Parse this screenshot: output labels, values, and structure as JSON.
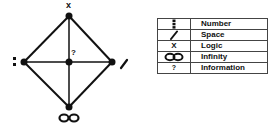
{
  "diagram": {
    "nodes": [
      {
        "id": "top",
        "symbol": "X",
        "meaning": "Logic",
        "x": 69,
        "y": 16
      },
      {
        "id": "left",
        "symbol": "⁝",
        "meaning": "Number",
        "x": 24,
        "y": 62
      },
      {
        "id": "right",
        "symbol": "/",
        "meaning": "Space",
        "x": 112,
        "y": 62
      },
      {
        "id": "bottom",
        "symbol": "∞",
        "meaning": "Infinity",
        "x": 69,
        "y": 107
      },
      {
        "id": "center",
        "symbol": "?",
        "meaning": "Information",
        "x": 69,
        "y": 62
      }
    ],
    "labels": {
      "top": "x",
      "center": "?",
      "bottom": "∞"
    },
    "edges": [
      [
        "top",
        "left"
      ],
      [
        "top",
        "right"
      ],
      [
        "bottom",
        "left"
      ],
      [
        "bottom",
        "right"
      ],
      [
        "top",
        "bottom"
      ],
      [
        "left",
        "right"
      ]
    ],
    "line_color": "#111111"
  },
  "legend": {
    "rows": [
      {
        "symbol_icon": "triple-dot-icon",
        "symbol": "⁝",
        "label": "Number"
      },
      {
        "symbol_icon": "slash-icon",
        "symbol": "/",
        "label": "Space"
      },
      {
        "symbol_icon": "x-icon",
        "symbol": "X",
        "label": "Logic"
      },
      {
        "symbol_icon": "infinity-icon",
        "symbol": "∞",
        "label": "Infinity"
      },
      {
        "symbol_icon": "question-icon",
        "symbol": "?",
        "label": "Information"
      }
    ]
  }
}
